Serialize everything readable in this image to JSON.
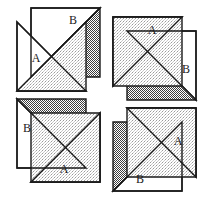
{
  "figure": {
    "width": 213,
    "height": 199,
    "background_color": "#ffffff",
    "stroke_color": "#1a1a1a",
    "fills": {
      "white": "#ffffff",
      "light_gray": "#d7d7d7",
      "dark_gray": "#6e6e6e"
    },
    "quadrants": [
      {
        "position": "top-left",
        "rotation_degrees": 0,
        "squares": [
          {
            "label": "A",
            "fill_upper": "white",
            "fill_lower": "light_gray"
          },
          {
            "label": "B",
            "fill_upper": "white",
            "fill_lower": "dark_gray"
          }
        ]
      },
      {
        "position": "top-right",
        "rotation_degrees": 90,
        "squares": [
          {
            "label": "A",
            "fill_upper": "white",
            "fill_lower": "light_gray"
          },
          {
            "label": "B",
            "fill_upper": "white",
            "fill_lower": "dark_gray"
          }
        ]
      },
      {
        "position": "bottom-right",
        "rotation_degrees": 180,
        "squares": [
          {
            "label": "A",
            "fill_upper": "white",
            "fill_lower": "light_gray"
          },
          {
            "label": "B",
            "fill_upper": "white",
            "fill_lower": "dark_gray"
          }
        ]
      },
      {
        "position": "bottom-left",
        "rotation_degrees": 270,
        "squares": [
          {
            "label": "A",
            "fill_upper": "white",
            "fill_lower": "light_gray"
          },
          {
            "label": "B",
            "fill_upper": "white",
            "fill_lower": "dark_gray"
          }
        ]
      }
    ],
    "labels": [
      {
        "id": "tl-b",
        "text": "B",
        "x": 73,
        "y": 21
      },
      {
        "id": "tl-a",
        "text": "A",
        "x": 36,
        "y": 59
      },
      {
        "id": "tr-a",
        "text": "A",
        "x": 152,
        "y": 31
      },
      {
        "id": "tr-b",
        "text": "B",
        "x": 186,
        "y": 70
      },
      {
        "id": "bl-b",
        "text": "B",
        "x": 27,
        "y": 129
      },
      {
        "id": "bl-a",
        "text": "A",
        "x": 64,
        "y": 170
      },
      {
        "id": "br-a",
        "text": "A",
        "x": 178,
        "y": 142
      },
      {
        "id": "br-b",
        "text": "B",
        "x": 140,
        "y": 180
      }
    ]
  }
}
